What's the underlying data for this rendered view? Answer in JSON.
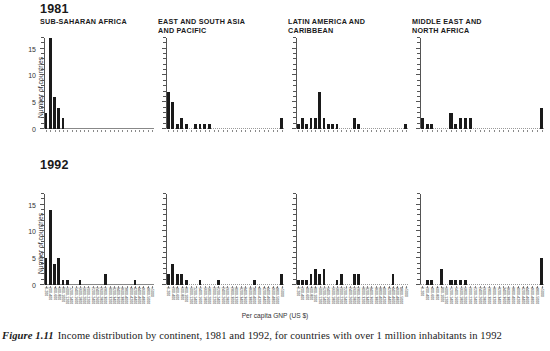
{
  "figure": {
    "caption_number": "Figure 1.11",
    "caption_text": "Income distribution by continent, 1981 and 1992, for countries with over 1 million inhabitants in 1992",
    "xaxis_title": "Per capita GNP (US $)",
    "yaxis_title": "Number of countries"
  },
  "rows": [
    {
      "year": "1981"
    },
    {
      "year": "1992"
    }
  ],
  "panels": [
    {
      "title": "SUB-SAHARAN AFRICA"
    },
    {
      "title": "EAST AND SOUTH ASIA\nAND PACIFIC"
    },
    {
      "title": "LATIN AMERICA AND\nCARIBBEAN"
    },
    {
      "title": "MIDDLE EAST AND\nNORTH AFRICA"
    }
  ],
  "chart_data": {
    "type": "bar",
    "title": "Income distribution by continent, 1981 and 1992, for countries with over 1 million inhabitants in 1992",
    "xlabel": "Per capita GNP (US $)",
    "ylabel": "Number of countries",
    "ylim": [
      0,
      17
    ],
    "yticks": [
      0,
      5,
      10,
      15
    ],
    "grid": false,
    "legend": "none",
    "categories": [
      "0-200",
      "200-400",
      "400-600",
      "600-800",
      "800-1000",
      "1000-1200",
      "1200-1400",
      "1400-1600",
      "1600-1800",
      "1800-2000",
      "2000-2200",
      "2200-2400",
      "2400-2600",
      "2600-2800",
      "2800-3000",
      "3000-3200",
      "3200-3400",
      "3400-3600",
      "3600-3800",
      "3800-4000",
      "4000-4200",
      "4200-4400",
      "4400-4600",
      "4600-4800",
      "4800-5000",
      ">5000"
    ],
    "panels": [
      {
        "region": "SUB-SAHARAN AFRICA",
        "series": [
          {
            "name": "1981",
            "values": [
              3,
              17,
              6,
              4,
              2,
              0,
              0,
              0,
              0,
              0,
              0,
              0,
              0,
              0,
              0,
              0,
              0,
              0,
              0,
              0,
              0,
              0,
              0,
              0,
              0,
              0
            ]
          },
          {
            "name": "1992",
            "values": [
              5,
              14,
              4,
              5,
              1,
              1,
              0,
              0,
              1,
              0,
              0,
              0,
              0,
              0,
              2,
              0,
              0,
              0,
              0,
              0,
              0,
              1,
              0,
              0,
              0,
              0
            ]
          }
        ]
      },
      {
        "region": "EAST AND SOUTH ASIA AND PACIFIC",
        "series": [
          {
            "name": "1981",
            "values": [
              7,
              5,
              1,
              2,
              1,
              0,
              1,
              1,
              1,
              1,
              0,
              0,
              0,
              0,
              0,
              0,
              0,
              0,
              0,
              0,
              0,
              0,
              0,
              0,
              0,
              2
            ]
          },
          {
            "name": "1992",
            "values": [
              2,
              4,
              2,
              2,
              1,
              0,
              0,
              1,
              0,
              0,
              0,
              1,
              0,
              0,
              0,
              0,
              0,
              0,
              0,
              1,
              0,
              0,
              0,
              0,
              0,
              2
            ]
          }
        ]
      },
      {
        "region": "LATIN AMERICA AND CARIBBEAN",
        "series": [
          {
            "name": "1981",
            "values": [
              1,
              2,
              1,
              2,
              2,
              7,
              2,
              1,
              1,
              1,
              0,
              0,
              0,
              2,
              1,
              0,
              0,
              0,
              0,
              0,
              0,
              0,
              0,
              0,
              0,
              1
            ]
          },
          {
            "name": "1992",
            "values": [
              1,
              1,
              1,
              2,
              3,
              2,
              3,
              0,
              0,
              1,
              2,
              0,
              0,
              2,
              2,
              0,
              0,
              0,
              0,
              0,
              0,
              0,
              2,
              0,
              0,
              0
            ]
          }
        ]
      },
      {
        "region": "MIDDLE EAST AND NORTH AFRICA",
        "series": [
          {
            "name": "1981",
            "values": [
              2,
              1,
              1,
              0,
              0,
              0,
              3,
              1,
              2,
              2,
              2,
              0,
              0,
              0,
              0,
              0,
              0,
              0,
              0,
              0,
              0,
              0,
              0,
              0,
              0,
              4
            ]
          },
          {
            "name": "1992",
            "values": [
              0,
              1,
              1,
              0,
              3,
              0,
              1,
              1,
              1,
              1,
              0,
              0,
              0,
              0,
              0,
              0,
              0,
              0,
              0,
              0,
              0,
              0,
              0,
              0,
              0,
              5
            ]
          }
        ]
      }
    ]
  }
}
